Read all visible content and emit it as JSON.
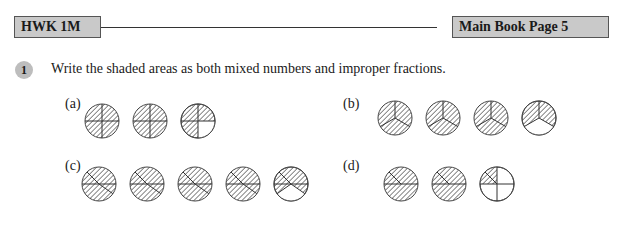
{
  "header": {
    "left_tag": "HWK 1M",
    "right_tag": "Main Book Page 5"
  },
  "question": {
    "number": "1",
    "text": "Write the shaded areas as both mixed numbers and improper fractions."
  },
  "parts": [
    {
      "label": "(a)",
      "divisions": "quarters",
      "circles": 3,
      "description": "2 fully shaded circles in quarters, third circle 3/4 shaded (bottom-right quarter white)"
    },
    {
      "label": "(b)",
      "divisions": "thirds",
      "circles": 4,
      "description": "3 fully shaded circles in thirds, fourth circle 2/3 shaded (bottom third white)"
    },
    {
      "label": "(c)",
      "circles": 5,
      "description": "4 fully shaded circles, fifth circle with bottom sector white"
    },
    {
      "label": "(d)",
      "circles": 3,
      "description": "2 fully shaded circles, third circle in quarters with upper-left quarter shaded"
    }
  ],
  "colors": {
    "tag_bg": "#c9c9c9",
    "qnum_bg": "#bdbdbd",
    "hatch": "#555555"
  }
}
